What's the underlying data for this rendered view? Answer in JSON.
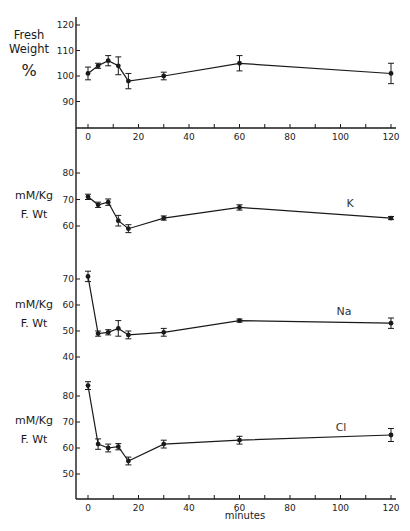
{
  "chart_data": [
    {
      "type": "line",
      "panel": "fresh_weight",
      "ylabel": "Fresh Weight %",
      "yticks": [
        90,
        100,
        110,
        120
      ],
      "ylim": [
        80,
        122
      ],
      "x": [
        0,
        4,
        8,
        12,
        16,
        30,
        60,
        120
      ],
      "values": [
        101,
        104,
        106,
        104,
        98,
        100,
        105,
        101
      ],
      "errors": [
        2.5,
        1,
        2,
        3.5,
        3,
        1.5,
        3,
        4
      ],
      "series_label": ""
    },
    {
      "type": "line",
      "panel": "K",
      "ylabel": "mM/Kg F. Wt",
      "yticks": [
        60,
        70,
        80
      ],
      "ylim": [
        50,
        82
      ],
      "x": [
        0,
        4,
        8,
        12,
        16,
        30,
        60,
        120
      ],
      "values": [
        71,
        68,
        69,
        62,
        59,
        63,
        67,
        63
      ],
      "errors": [
        1,
        1,
        1.2,
        2,
        1.5,
        0.8,
        1,
        0.6
      ],
      "series_label": "K"
    },
    {
      "type": "line",
      "panel": "Na",
      "ylabel": "mM/Kg F. Wt",
      "yticks": [
        40,
        50,
        60,
        70
      ],
      "ylim": [
        38,
        73
      ],
      "x": [
        0,
        4,
        8,
        12,
        16,
        30,
        60,
        120
      ],
      "values": [
        71,
        49,
        49.5,
        51,
        48.5,
        49.5,
        54,
        53
      ],
      "errors": [
        2,
        1,
        1,
        3,
        1.5,
        1.5,
        0.6,
        2
      ],
      "series_label": "Na"
    },
    {
      "type": "line",
      "panel": "Cl",
      "ylabel": "mM/Kg F. Wt",
      "yticks": [
        50,
        60,
        70,
        80
      ],
      "ylim": [
        40,
        86
      ],
      "x": [
        0,
        4,
        8,
        12,
        16,
        30,
        60,
        120
      ],
      "values": [
        84,
        61.5,
        60,
        60.5,
        55,
        61.5,
        63,
        65
      ],
      "errors": [
        1.5,
        2,
        1.5,
        1.2,
        1.5,
        1.5,
        1.5,
        2.5
      ],
      "series_label": "Cl"
    }
  ],
  "axes": {
    "xticks": [
      0,
      20,
      40,
      60,
      80,
      100,
      120
    ],
    "xlabel": "minutes",
    "xlim": [
      0,
      120
    ]
  },
  "labels": {
    "fw_line1": "Fresh",
    "fw_line2": "Weight",
    "fw_line3": "%",
    "k_line1": "mM/Kg",
    "k_line2": "F. Wt",
    "na_line1": "mM/Kg",
    "na_line2": "F. Wt",
    "cl_line1": "mM/Kg",
    "cl_line2": "F. Wt"
  }
}
